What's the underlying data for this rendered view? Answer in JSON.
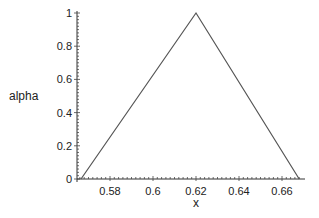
{
  "chart_data": {
    "type": "line",
    "title": "",
    "xlabel": "x",
    "ylabel": "alpha",
    "xlim": [
      0.5635,
      0.6695
    ],
    "ylim": [
      0,
      1
    ],
    "x_ticks": [
      "0.58",
      "0.6",
      "0.62",
      "0.64",
      "0.66"
    ],
    "x_tick_values": [
      0.58,
      0.6,
      0.62,
      0.64,
      0.66
    ],
    "y_ticks": [
      "0",
      "0.2",
      "0.4",
      "0.6",
      "0.8",
      "1"
    ],
    "y_tick_values": [
      0,
      0.2,
      0.4,
      0.6,
      0.8,
      1
    ],
    "grid": false,
    "legend": null,
    "series": [
      {
        "name": "alpha",
        "x": [
          0.5665,
          0.62,
          0.668
        ],
        "y": [
          0,
          1,
          0
        ],
        "color": "#555555"
      }
    ]
  }
}
